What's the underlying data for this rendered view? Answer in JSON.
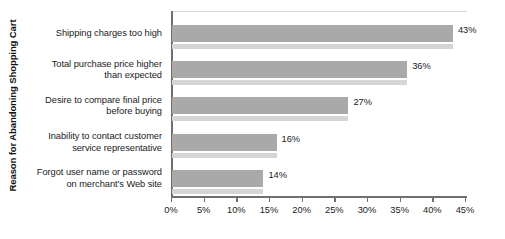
{
  "chart_data": {
    "type": "bar",
    "orientation": "horizontal",
    "title": "",
    "xlabel": "",
    "ylabel": "Reason for Abandoning Shopping Cart",
    "categories": [
      "Shipping charges too high",
      "Total purchase price higher than expected",
      "Desire to compare final price before buying",
      "Inability to contact customer service representative",
      "Forgot user name or password on merchant's Web site"
    ],
    "category_lines": [
      [
        "Shipping charges too high"
      ],
      [
        "Total purchase price higher",
        "than expected"
      ],
      [
        "Desire to compare final price",
        "before buying"
      ],
      [
        "Inability to contact customer",
        "service representative"
      ],
      [
        "Forgot user name or password",
        "on merchant's Web site"
      ]
    ],
    "values": [
      43,
      36,
      27,
      16,
      14
    ],
    "value_labels": [
      "43%",
      "36%",
      "27%",
      "16%",
      "14%"
    ],
    "xlim": [
      0,
      45
    ],
    "xticks": [
      0,
      5,
      10,
      15,
      20,
      25,
      30,
      35,
      40,
      45
    ],
    "xtick_labels": [
      "0%",
      "5%",
      "10%",
      "15%",
      "20%",
      "25%",
      "30%",
      "35%",
      "40%",
      "45%"
    ],
    "grid": false,
    "legend": null,
    "colors": {
      "bar": "#a9a9a9",
      "bar_shadow": "#d5d5d5",
      "axis": "#6f6f6f",
      "text": "#1a1a1a",
      "background": "#ffffff"
    }
  }
}
